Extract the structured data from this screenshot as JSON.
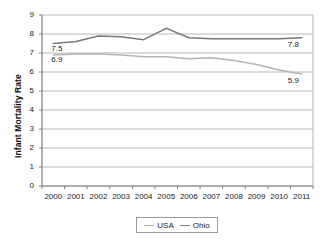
{
  "chart_data": {
    "type": "line",
    "title": "",
    "xlabel": "",
    "ylabel": "Infant Mortality Rate",
    "categories": [
      "2000",
      "2001",
      "2002",
      "2003",
      "2004",
      "2005",
      "2006",
      "2007",
      "2008",
      "2009",
      "2010",
      "2011"
    ],
    "ylim": [
      0,
      9
    ],
    "yticks": [
      "0",
      "1",
      "2",
      "3",
      "4",
      "5",
      "6",
      "7",
      "8",
      "9"
    ],
    "grid": true,
    "legend_position": "bottom",
    "series": [
      {
        "name": "USA",
        "color": "#b3b3b3",
        "values": [
          6.9,
          6.95,
          6.95,
          6.9,
          6.8,
          6.8,
          6.7,
          6.75,
          6.6,
          6.4,
          6.1,
          5.9
        ]
      },
      {
        "name": "Ohio",
        "color": "#7a7a7a",
        "values": [
          7.5,
          7.6,
          7.9,
          7.85,
          7.7,
          8.3,
          7.8,
          7.75,
          7.75,
          7.75,
          7.75,
          7.8
        ]
      }
    ],
    "annotations": [
      {
        "text": "7.5",
        "series": "Ohio",
        "category": "2000",
        "position": "left"
      },
      {
        "text": "6.9",
        "series": "USA",
        "category": "2000",
        "position": "left"
      },
      {
        "text": "7.8",
        "series": "Ohio",
        "category": "2011",
        "position": "right"
      },
      {
        "text": "5.9",
        "series": "USA",
        "category": "2011",
        "position": "right"
      }
    ]
  },
  "legend": {
    "items": [
      {
        "label": "USA"
      },
      {
        "label": "Ohio"
      }
    ]
  },
  "colors": {
    "usa_line": "#b3b3b3",
    "ohio_line": "#7a7a7a",
    "gridline": "#a6a6a6",
    "axis": "#808080",
    "text": "#1a1a1a"
  }
}
